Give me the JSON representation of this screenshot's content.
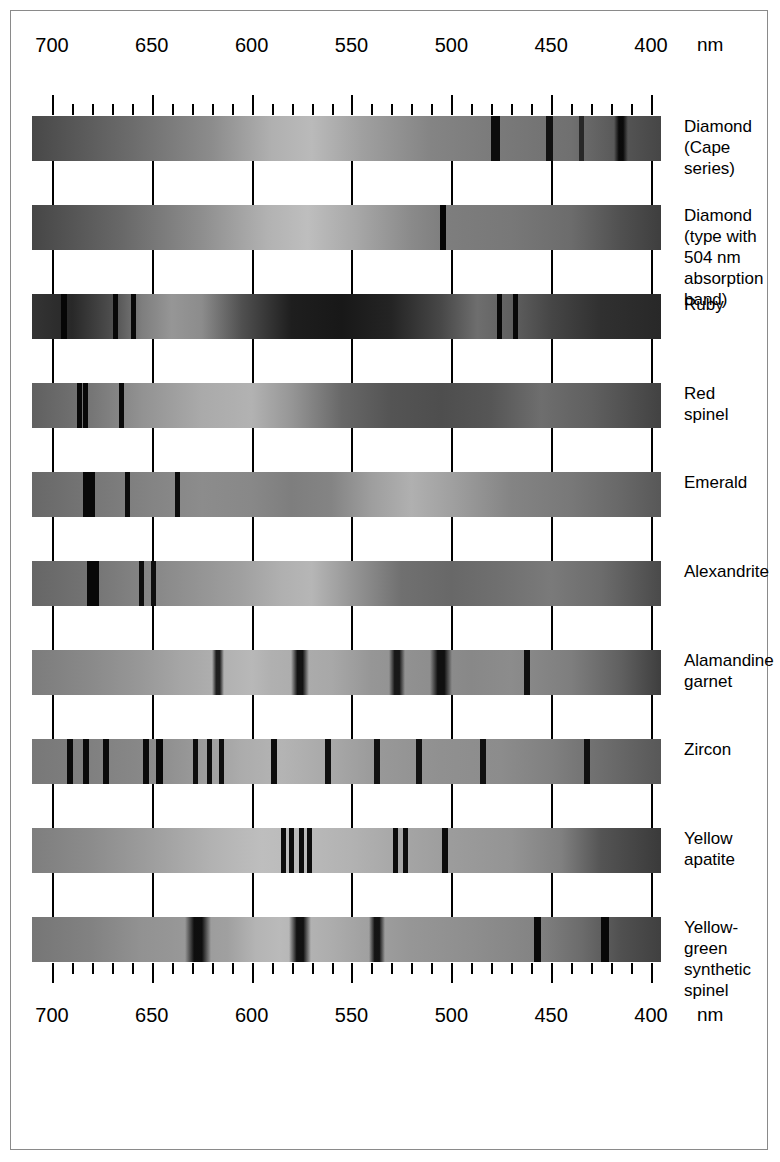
{
  "figure": {
    "unit_label": "nm",
    "axis_ticks_major": [
      700,
      650,
      600,
      550,
      500,
      450,
      400
    ],
    "axis_tick_labels_top": [
      "700",
      "650",
      "600",
      "550",
      "500",
      "450",
      "400"
    ],
    "axis_tick_labels_bottom": [
      "700",
      "650",
      "600",
      "550",
      "500",
      "450",
      "400"
    ],
    "axis_range_nm": [
      710,
      395
    ],
    "minor_tick_step_nm": 10,
    "major_tick_step_nm": 50,
    "background_color": "#ffffff",
    "border_color": "#8a8a8a",
    "tick_color": "#000000"
  },
  "chart_data": {
    "type": "heatmap",
    "xlabel": "nm",
    "ylabel": "",
    "xlim": [
      710,
      395
    ],
    "grid": true,
    "legend": "none",
    "categories": [
      "Diamond (Cape series)",
      "Diamond (type with 504 nm absorption band)",
      "Ruby",
      "Red spinel",
      "Emerald",
      "Alexandrite",
      "Alamandine garnet",
      "Zircon",
      "Yellow apatite",
      "Yellow-green synthetic spinel"
    ],
    "series": [
      {
        "name": "Diamond (Cape series)",
        "label": "Diamond\n(Cape\nseries)",
        "base_gradient": [
          {
            "nm": 710,
            "gray": 72
          },
          {
            "nm": 660,
            "gray": 108
          },
          {
            "nm": 620,
            "gray": 140
          },
          {
            "nm": 590,
            "gray": 176
          },
          {
            "nm": 570,
            "gray": 186
          },
          {
            "nm": 545,
            "gray": 160
          },
          {
            "nm": 510,
            "gray": 132
          },
          {
            "nm": 470,
            "gray": 120
          },
          {
            "nm": 440,
            "gray": 112
          },
          {
            "nm": 415,
            "gray": 86
          },
          {
            "nm": 395,
            "gray": 70
          }
        ],
        "lines": [
          {
            "nm": 478,
            "width_nm": 4.5,
            "gray": 12
          },
          {
            "nm": 451,
            "width_nm": 3.5,
            "gray": 18
          },
          {
            "nm": 435,
            "width_nm": 2.5,
            "gray": 40
          },
          {
            "nm": 415,
            "width_nm": 7.0,
            "gray": 8
          }
        ]
      },
      {
        "name": "Diamond (type with 504 nm absorption band)",
        "label": "Diamond\n(type with\n504 nm\nabsorption\nband)",
        "base_gradient": [
          {
            "nm": 710,
            "gray": 70
          },
          {
            "nm": 665,
            "gray": 104
          },
          {
            "nm": 625,
            "gray": 142
          },
          {
            "nm": 592,
            "gray": 178
          },
          {
            "nm": 572,
            "gray": 190
          },
          {
            "nm": 548,
            "gray": 168
          },
          {
            "nm": 520,
            "gray": 138
          },
          {
            "nm": 504,
            "gray": 126
          },
          {
            "nm": 470,
            "gray": 120
          },
          {
            "nm": 440,
            "gray": 108
          },
          {
            "nm": 415,
            "gray": 80
          },
          {
            "nm": 395,
            "gray": 62
          }
        ],
        "lines": [
          {
            "nm": 504,
            "width_nm": 3.0,
            "gray": 6
          }
        ]
      },
      {
        "name": "Ruby",
        "label": "Ruby",
        "base_gradient": [
          {
            "nm": 710,
            "gray": 52
          },
          {
            "nm": 690,
            "gray": 40
          },
          {
            "nm": 670,
            "gray": 78
          },
          {
            "nm": 655,
            "gray": 126
          },
          {
            "nm": 640,
            "gray": 150
          },
          {
            "nm": 625,
            "gray": 140
          },
          {
            "nm": 605,
            "gray": 80
          },
          {
            "nm": 580,
            "gray": 30
          },
          {
            "nm": 555,
            "gray": 24
          },
          {
            "nm": 530,
            "gray": 36
          },
          {
            "nm": 505,
            "gray": 72
          },
          {
            "nm": 487,
            "gray": 110
          },
          {
            "nm": 470,
            "gray": 96
          },
          {
            "nm": 450,
            "gray": 70
          },
          {
            "nm": 425,
            "gray": 48
          },
          {
            "nm": 395,
            "gray": 40
          }
        ],
        "lines": [
          {
            "nm": 694,
            "width_nm": 3.0,
            "gray": 6
          },
          {
            "nm": 668,
            "width_nm": 2.5,
            "gray": 8
          },
          {
            "nm": 659,
            "width_nm": 2.5,
            "gray": 8
          },
          {
            "nm": 476,
            "width_nm": 2.5,
            "gray": 8
          },
          {
            "nm": 468,
            "width_nm": 2.5,
            "gray": 8
          }
        ]
      },
      {
        "name": "Red spinel",
        "label": "Red\nspinel",
        "base_gradient": [
          {
            "nm": 710,
            "gray": 96
          },
          {
            "nm": 680,
            "gray": 118
          },
          {
            "nm": 655,
            "gray": 146
          },
          {
            "nm": 625,
            "gray": 170
          },
          {
            "nm": 600,
            "gray": 178
          },
          {
            "nm": 580,
            "gray": 150
          },
          {
            "nm": 555,
            "gray": 104
          },
          {
            "nm": 530,
            "gray": 84
          },
          {
            "nm": 505,
            "gray": 78
          },
          {
            "nm": 480,
            "gray": 86
          },
          {
            "nm": 455,
            "gray": 110
          },
          {
            "nm": 430,
            "gray": 96
          },
          {
            "nm": 395,
            "gray": 66
          }
        ],
        "lines": [
          {
            "nm": 686,
            "width_nm": 2.5,
            "gray": 8
          },
          {
            "nm": 683,
            "width_nm": 2.5,
            "gray": 8
          },
          {
            "nm": 665,
            "width_nm": 2.5,
            "gray": 10
          }
        ]
      },
      {
        "name": "Emerald",
        "label": "Emerald",
        "base_gradient": [
          {
            "nm": 710,
            "gray": 104
          },
          {
            "nm": 680,
            "gray": 118
          },
          {
            "nm": 650,
            "gray": 132
          },
          {
            "nm": 625,
            "gray": 140
          },
          {
            "nm": 600,
            "gray": 136
          },
          {
            "nm": 580,
            "gray": 126
          },
          {
            "nm": 560,
            "gray": 132
          },
          {
            "nm": 540,
            "gray": 158
          },
          {
            "nm": 520,
            "gray": 176
          },
          {
            "nm": 500,
            "gray": 160
          },
          {
            "nm": 470,
            "gray": 132
          },
          {
            "nm": 440,
            "gray": 120
          },
          {
            "nm": 415,
            "gray": 104
          },
          {
            "nm": 395,
            "gray": 88
          }
        ],
        "lines": [
          {
            "nm": 683,
            "width_nm": 3.0,
            "gray": 8
          },
          {
            "nm": 680,
            "width_nm": 3.0,
            "gray": 8
          },
          {
            "nm": 662,
            "width_nm": 2.5,
            "gray": 12
          },
          {
            "nm": 637,
            "width_nm": 2.5,
            "gray": 12
          }
        ]
      },
      {
        "name": "Alexandrite",
        "label": "Alexandrite",
        "base_gradient": [
          {
            "nm": 710,
            "gray": 102
          },
          {
            "nm": 680,
            "gray": 116
          },
          {
            "nm": 655,
            "gray": 132
          },
          {
            "nm": 630,
            "gray": 146
          },
          {
            "nm": 605,
            "gray": 160
          },
          {
            "nm": 585,
            "gray": 176
          },
          {
            "nm": 570,
            "gray": 182
          },
          {
            "nm": 550,
            "gray": 150
          },
          {
            "nm": 525,
            "gray": 112
          },
          {
            "nm": 500,
            "gray": 104
          },
          {
            "nm": 475,
            "gray": 112
          },
          {
            "nm": 450,
            "gray": 122
          },
          {
            "nm": 425,
            "gray": 108
          },
          {
            "nm": 395,
            "gray": 74
          }
        ],
        "lines": [
          {
            "nm": 681,
            "width_nm": 3.0,
            "gray": 8
          },
          {
            "nm": 678,
            "width_nm": 3.0,
            "gray": 8
          },
          {
            "nm": 655,
            "width_nm": 2.5,
            "gray": 14
          },
          {
            "nm": 649,
            "width_nm": 2.5,
            "gray": 14
          }
        ]
      },
      {
        "name": "Alamandine garnet",
        "label": "Alamandine\ngarnet",
        "base_gradient": [
          {
            "nm": 710,
            "gray": 124
          },
          {
            "nm": 680,
            "gray": 138
          },
          {
            "nm": 655,
            "gray": 152
          },
          {
            "nm": 635,
            "gray": 166
          },
          {
            "nm": 600,
            "gray": 184
          },
          {
            "nm": 590,
            "gray": 176
          },
          {
            "nm": 560,
            "gray": 168
          },
          {
            "nm": 540,
            "gray": 150
          },
          {
            "nm": 490,
            "gray": 136
          },
          {
            "nm": 470,
            "gray": 140
          },
          {
            "nm": 440,
            "gray": 126
          },
          {
            "nm": 415,
            "gray": 96
          },
          {
            "nm": 395,
            "gray": 62
          }
        ],
        "lines": [
          {
            "nm": 617,
            "width_nm": 6.0,
            "gray": 26
          },
          {
            "nm": 576,
            "width_nm": 9.0,
            "gray": 14
          },
          {
            "nm": 527,
            "width_nm": 8.0,
            "gray": 20
          },
          {
            "nm": 505,
            "width_nm": 11.0,
            "gray": 12
          },
          {
            "nm": 462,
            "width_nm": 3.0,
            "gray": 16
          }
        ]
      },
      {
        "name": "Zircon",
        "label": "Zircon",
        "base_gradient": [
          {
            "nm": 710,
            "gray": 120
          },
          {
            "nm": 680,
            "gray": 128
          },
          {
            "nm": 655,
            "gray": 136
          },
          {
            "nm": 630,
            "gray": 152
          },
          {
            "nm": 605,
            "gray": 172
          },
          {
            "nm": 585,
            "gray": 180
          },
          {
            "nm": 560,
            "gray": 168
          },
          {
            "nm": 535,
            "gray": 152
          },
          {
            "nm": 505,
            "gray": 144
          },
          {
            "nm": 475,
            "gray": 140
          },
          {
            "nm": 450,
            "gray": 128
          },
          {
            "nm": 425,
            "gray": 110
          },
          {
            "nm": 395,
            "gray": 88
          }
        ],
        "lines": [
          {
            "nm": 691,
            "width_nm": 3.0,
            "gray": 10
          },
          {
            "nm": 683,
            "width_nm": 3.0,
            "gray": 10
          },
          {
            "nm": 673,
            "width_nm": 3.0,
            "gray": 10
          },
          {
            "nm": 653,
            "width_nm": 3.0,
            "gray": 10
          },
          {
            "nm": 646,
            "width_nm": 3.5,
            "gray": 8
          },
          {
            "nm": 628,
            "width_nm": 2.5,
            "gray": 14
          },
          {
            "nm": 621,
            "width_nm": 2.5,
            "gray": 14
          },
          {
            "nm": 615,
            "width_nm": 2.5,
            "gray": 14
          },
          {
            "nm": 589,
            "width_nm": 3.0,
            "gray": 12
          },
          {
            "nm": 562,
            "width_nm": 3.0,
            "gray": 16
          },
          {
            "nm": 537,
            "width_nm": 3.0,
            "gray": 18
          },
          {
            "nm": 516,
            "width_nm": 3.0,
            "gray": 18
          },
          {
            "nm": 484,
            "width_nm": 3.0,
            "gray": 16
          },
          {
            "nm": 432,
            "width_nm": 3.0,
            "gray": 16
          }
        ]
      },
      {
        "name": "Yellow apatite",
        "label": "Yellow\napatite",
        "base_gradient": [
          {
            "nm": 710,
            "gray": 126
          },
          {
            "nm": 680,
            "gray": 140
          },
          {
            "nm": 650,
            "gray": 158
          },
          {
            "nm": 620,
            "gray": 178
          },
          {
            "nm": 595,
            "gray": 190
          },
          {
            "nm": 575,
            "gray": 186
          },
          {
            "nm": 550,
            "gray": 178
          },
          {
            "nm": 525,
            "gray": 166
          },
          {
            "nm": 500,
            "gray": 156
          },
          {
            "nm": 470,
            "gray": 148
          },
          {
            "nm": 445,
            "gray": 128
          },
          {
            "nm": 425,
            "gray": 84
          },
          {
            "nm": 395,
            "gray": 58
          }
        ],
        "lines": [
          {
            "nm": 584,
            "width_nm": 2.5,
            "gray": 12
          },
          {
            "nm": 580,
            "width_nm": 2.5,
            "gray": 12
          },
          {
            "nm": 575,
            "width_nm": 2.5,
            "gray": 12
          },
          {
            "nm": 571,
            "width_nm": 2.5,
            "gray": 12
          },
          {
            "nm": 528,
            "width_nm": 2.5,
            "gray": 12
          },
          {
            "nm": 523,
            "width_nm": 2.5,
            "gray": 12
          },
          {
            "nm": 503,
            "width_nm": 3.0,
            "gray": 12
          }
        ]
      },
      {
        "name": "Yellow-green synthetic spinel",
        "label": "Yellow-\ngreen\nsynthetic\nspinel",
        "base_gradient": [
          {
            "nm": 710,
            "gray": 118
          },
          {
            "nm": 680,
            "gray": 130
          },
          {
            "nm": 655,
            "gray": 146
          },
          {
            "nm": 640,
            "gray": 150
          },
          {
            "nm": 612,
            "gray": 160
          },
          {
            "nm": 598,
            "gray": 180
          },
          {
            "nm": 586,
            "gray": 186
          },
          {
            "nm": 562,
            "gray": 174
          },
          {
            "nm": 545,
            "gray": 162
          },
          {
            "nm": 520,
            "gray": 150
          },
          {
            "nm": 490,
            "gray": 142
          },
          {
            "nm": 460,
            "gray": 132
          },
          {
            "nm": 435,
            "gray": 108
          },
          {
            "nm": 415,
            "gray": 80
          },
          {
            "nm": 395,
            "gray": 64
          }
        ],
        "lines": [
          {
            "nm": 627,
            "width_nm": 13.0,
            "gray": 10
          },
          {
            "nm": 576,
            "width_nm": 11.0,
            "gray": 12
          },
          {
            "nm": 537,
            "width_nm": 8.0,
            "gray": 16
          },
          {
            "nm": 457,
            "width_nm": 3.5,
            "gray": 10
          },
          {
            "nm": 423,
            "width_nm": 4.0,
            "gray": 8
          }
        ]
      }
    ]
  }
}
